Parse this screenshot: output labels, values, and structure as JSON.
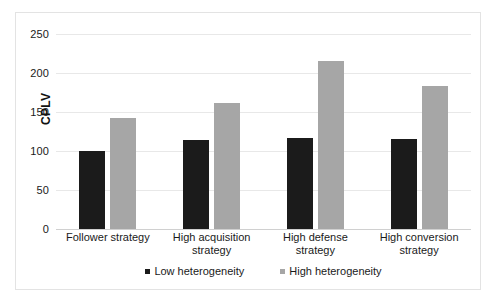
{
  "chart_data": {
    "type": "bar",
    "title": "",
    "xlabel": "",
    "ylabel": "CPLV",
    "ylim": [
      0,
      250
    ],
    "yticks": [
      "0",
      "50",
      "100",
      "150",
      "200",
      "250"
    ],
    "grid": true,
    "legend_position": "bottom",
    "categories": [
      "Follower strategy",
      "High acquisition strategy",
      "High defense strategy",
      "High conversion strategy"
    ],
    "series": [
      {
        "name": "Low heterogeneity",
        "color": "#1b1b1b",
        "values": [
          100,
          114,
          117,
          115
        ]
      },
      {
        "name": "High heterogeneity",
        "color": "#a6a6a6",
        "values": [
          142,
          162,
          215,
          183
        ]
      }
    ]
  },
  "legend": {
    "items": [
      {
        "label": "Low heterogeneity",
        "marker": "square-marker-dark"
      },
      {
        "label": "High heterogeneity",
        "marker": "square-marker-gray"
      }
    ]
  }
}
